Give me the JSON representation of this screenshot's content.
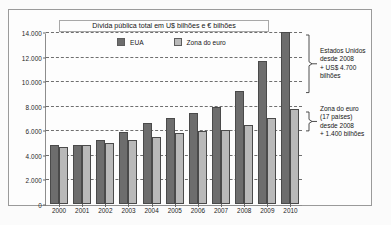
{
  "chart_data": {
    "type": "bar",
    "title": "Dívida pública total em U$ bilhões e € bilhões",
    "xlabel": "",
    "ylabel": "",
    "ylim": [
      0,
      14000
    ],
    "yticks": [
      "0",
      "2.000",
      "4.000",
      "6.000",
      "8.000",
      "10.000",
      "12.000",
      "14.000"
    ],
    "ytick_values": [
      0,
      2000,
      4000,
      6000,
      8000,
      10000,
      12000,
      14000
    ],
    "grid": true,
    "legend_position": "top-center",
    "categories": [
      "2000",
      "2001",
      "2002",
      "2003",
      "2004",
      "2005",
      "2006",
      "2007",
      "2008",
      "2009",
      "2010"
    ],
    "series": [
      {
        "name": "EUA",
        "color": "#6d6d6d",
        "values": [
          4800,
          4800,
          5200,
          5850,
          6550,
          7000,
          7400,
          7850,
          9150,
          11600,
          13950
        ]
      },
      {
        "name": "Zona do euro",
        "color": "#b9b9b9",
        "values": [
          4600,
          4750,
          4950,
          5200,
          5450,
          5750,
          5900,
          6000,
          6400,
          7000,
          7700
        ]
      }
    ],
    "annotations": [
      {
        "id": "usa-bracket",
        "lines": [
          "Estados Unidos",
          "desde 2008",
          "+ US$ 4.700",
          "bilhões"
        ],
        "bracket_from": 14000,
        "bracket_to": 9150
      },
      {
        "id": "euro-bracket",
        "lines": [
          "Zona do euro",
          "(17 países)",
          "desde 2008",
          "+ 1.400 bilhões"
        ],
        "bracket_from": 7700,
        "bracket_to": 6000
      }
    ]
  }
}
